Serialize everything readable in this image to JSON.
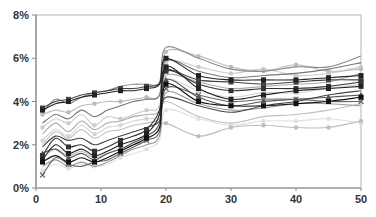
{
  "chart_data": {
    "type": "line",
    "title": "",
    "xlabel": "",
    "ylabel": "",
    "xlim": [
      0,
      50
    ],
    "ylim": [
      0,
      8
    ],
    "x_ticks": [
      0,
      10,
      20,
      30,
      40,
      50
    ],
    "y_ticks": [
      "0%",
      "2%",
      "4%",
      "6%",
      "8%"
    ],
    "grid": false,
    "legend": "none",
    "x": [
      1,
      3,
      5,
      7,
      9,
      11,
      13,
      15,
      17,
      19,
      20,
      25,
      30,
      35,
      40,
      45,
      50
    ],
    "series": [
      {
        "name": "s1",
        "color": "#222222",
        "marker": "square",
        "values": [
          3.6,
          3.9,
          4.0,
          4.2,
          4.3,
          4.4,
          4.5,
          4.5,
          4.6,
          4.8,
          6.0,
          5.2,
          5.0,
          5.0,
          5.0,
          5.1,
          5.2
        ]
      },
      {
        "name": "s2",
        "color": "#444444",
        "marker": "square",
        "values": [
          3.7,
          4.0,
          4.1,
          4.3,
          4.4,
          4.5,
          4.6,
          4.6,
          4.7,
          4.8,
          5.5,
          5.0,
          4.9,
          4.8,
          4.9,
          5.0,
          5.0
        ]
      },
      {
        "name": "s3",
        "color": "#888888",
        "marker": "none",
        "values": [
          3.5,
          4.1,
          3.9,
          4.2,
          4.4,
          4.5,
          4.7,
          4.8,
          4.8,
          4.9,
          6.5,
          6.0,
          5.5,
          5.4,
          5.6,
          5.6,
          6.1
        ]
      },
      {
        "name": "s4",
        "color": "#bbbbbb",
        "marker": "circle",
        "values": [
          3.4,
          3.6,
          3.5,
          3.8,
          3.9,
          4.0,
          4.0,
          4.1,
          4.2,
          4.3,
          6.3,
          6.1,
          5.6,
          5.4,
          5.7,
          5.4,
          5.5
        ]
      },
      {
        "name": "s5",
        "color": "#cccccc",
        "marker": "circle",
        "values": [
          2.8,
          3.2,
          3.0,
          3.4,
          2.9,
          3.3,
          3.2,
          3.4,
          3.6,
          3.8,
          5.8,
          5.6,
          5.3,
          5.5,
          5.2,
          5.3,
          5.6
        ]
      },
      {
        "name": "s6",
        "color": "#aaaaaa",
        "marker": "none",
        "values": [
          2.5,
          3.0,
          2.6,
          3.1,
          2.7,
          3.0,
          3.1,
          3.3,
          3.4,
          3.6,
          5.2,
          4.9,
          4.6,
          4.7,
          4.8,
          4.9,
          5.3
        ]
      },
      {
        "name": "s7",
        "color": "#d5d5d5",
        "marker": "circle",
        "values": [
          2.2,
          2.7,
          2.4,
          2.9,
          2.5,
          2.8,
          2.9,
          3.1,
          3.2,
          3.4,
          5.0,
          4.5,
          4.2,
          4.4,
          4.4,
          4.6,
          4.8
        ]
      },
      {
        "name": "s8",
        "color": "#333333",
        "marker": "square",
        "values": [
          1.5,
          2.3,
          1.9,
          2.0,
          1.7,
          1.9,
          2.2,
          2.4,
          2.7,
          3.6,
          5.4,
          4.8,
          4.5,
          4.6,
          4.6,
          4.7,
          4.9
        ]
      },
      {
        "name": "s9",
        "color": "#222222",
        "marker": "square",
        "values": [
          1.3,
          2.0,
          1.6,
          1.8,
          1.5,
          1.7,
          2.0,
          2.2,
          2.5,
          3.4,
          5.6,
          4.6,
          4.1,
          4.3,
          4.5,
          4.6,
          4.7
        ]
      },
      {
        "name": "s10",
        "color": "#555555",
        "marker": "triangle",
        "values": [
          1.6,
          1.8,
          1.4,
          1.6,
          1.3,
          1.6,
          1.8,
          2.1,
          2.4,
          3.0,
          5.0,
          4.2,
          3.8,
          4.0,
          4.1,
          4.2,
          4.3
        ]
      },
      {
        "name": "s11",
        "color": "#111111",
        "marker": "square",
        "values": [
          1.2,
          1.5,
          1.2,
          1.4,
          1.2,
          1.4,
          1.7,
          2.0,
          2.3,
          2.8,
          4.8,
          4.0,
          3.8,
          3.8,
          3.9,
          4.0,
          4.2
        ]
      },
      {
        "name": "s12",
        "color": "#666666",
        "marker": "x",
        "values": [
          0.6,
          1.4,
          1.1,
          1.0,
          1.2,
          1.3,
          1.6,
          1.9,
          2.2,
          2.6,
          4.6,
          4.3,
          4.0,
          4.1,
          4.1,
          4.0,
          4.0
        ]
      },
      {
        "name": "s13",
        "color": "#999999",
        "marker": "none",
        "values": [
          1.0,
          1.3,
          1.0,
          1.2,
          1.0,
          1.2,
          1.5,
          1.8,
          2.0,
          2.4,
          4.4,
          3.9,
          3.6,
          3.7,
          3.9,
          3.9,
          3.8
        ]
      },
      {
        "name": "s14",
        "color": "#e0e0e0",
        "marker": "circle",
        "values": [
          0.8,
          1.1,
          0.9,
          1.1,
          1.0,
          1.1,
          1.4,
          1.6,
          1.8,
          2.2,
          3.6,
          3.2,
          2.9,
          3.1,
          3.1,
          3.2,
          3.0
        ]
      },
      {
        "name": "s15",
        "color": "#444444",
        "marker": "none",
        "values": [
          1.9,
          2.4,
          2.2,
          2.3,
          2.0,
          2.2,
          2.4,
          2.6,
          2.8,
          3.1,
          4.2,
          3.8,
          3.5,
          3.8,
          4.0,
          4.3,
          4.5
        ]
      },
      {
        "name": "s16",
        "color": "#c0c0c0",
        "marker": "none",
        "values": [
          2.0,
          2.6,
          2.3,
          2.7,
          2.3,
          2.6,
          2.7,
          2.9,
          3.0,
          3.2,
          4.0,
          3.3,
          3.0,
          3.3,
          3.4,
          3.6,
          3.9
        ]
      },
      {
        "name": "s17",
        "color": "#777777",
        "marker": "none",
        "values": [
          3.0,
          3.4,
          3.2,
          3.6,
          3.3,
          3.6,
          3.8,
          4.0,
          4.1,
          4.3,
          5.9,
          5.4,
          5.1,
          5.2,
          5.3,
          5.5,
          5.8
        ]
      },
      {
        "name": "s18",
        "color": "#bdbdbd",
        "marker": "circle",
        "values": [
          1.4,
          1.8,
          1.5,
          1.7,
          1.4,
          1.6,
          1.8,
          2.0,
          2.2,
          2.7,
          3.0,
          2.4,
          2.8,
          2.9,
          2.8,
          2.8,
          3.1
        ]
      }
    ]
  }
}
